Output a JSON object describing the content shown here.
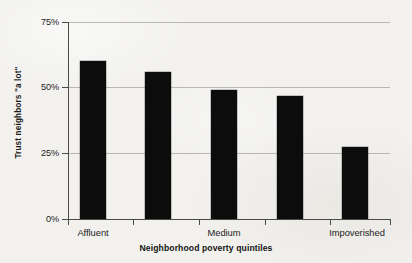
{
  "chart_data": {
    "type": "bar",
    "title": "",
    "xlabel": "Neighborhood poverty quintiles",
    "ylabel": "Trust neighbors \"a lot\"",
    "categories": [
      "Affluent",
      "",
      "Medium",
      "",
      "Impoverished"
    ],
    "tick_labels": [
      "Affluent",
      "Medium",
      "Impoverished"
    ],
    "values": [
      60,
      56,
      49,
      47,
      27.5
    ],
    "ylim": [
      0,
      75
    ],
    "yticks": [
      0,
      25,
      50,
      75
    ],
    "ytick_labels": [
      "0%",
      "25%",
      "50%",
      "75%"
    ],
    "grid": "horizontal",
    "legend": "none",
    "bar_color": "#0d0c0c",
    "axis_color": "#4a4a4a",
    "grid_color": "#b9b7b2",
    "background_color": "#f2f1ee"
  },
  "axes": {
    "y_title": "Trust neighbors \"a lot\"",
    "x_title": "Neighborhood poverty quintiles",
    "y_ticks": [
      {
        "label": "75%",
        "value": 75
      },
      {
        "label": "50%",
        "value": 50
      },
      {
        "label": "25%",
        "value": 25
      },
      {
        "label": "0%",
        "value": 0
      }
    ],
    "x_ticks": [
      {
        "label": "Affluent"
      },
      {
        "label": "Medium"
      },
      {
        "label": "Impoverished"
      }
    ]
  },
  "bars": [
    {
      "category": "Affluent",
      "value": 60
    },
    {
      "category": "",
      "value": 56
    },
    {
      "category": "Medium",
      "value": 49
    },
    {
      "category": "",
      "value": 47
    },
    {
      "category": "Impoverished",
      "value": 27.5
    }
  ]
}
